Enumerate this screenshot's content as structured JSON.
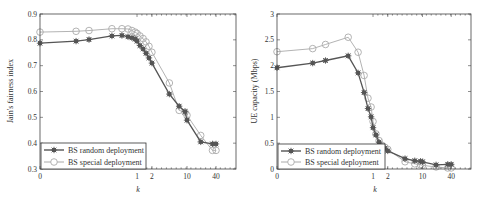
{
  "chart_data": [
    {
      "type": "line",
      "title": "",
      "xlabel": "k",
      "ylabel": "Jain's fairness index",
      "xscale": "symlog",
      "xticks": [
        "0",
        "1",
        "2",
        "10",
        "40"
      ],
      "xtick_pos": [
        0.0,
        0.495,
        0.571,
        0.75,
        0.898
      ],
      "ylim": [
        0.3,
        0.9
      ],
      "yticks": [
        "0.3",
        "0.4",
        "0.5",
        "0.6",
        "0.7",
        "0.8",
        "0.9"
      ],
      "grid": false,
      "legend_position": "lower left",
      "x_pos": [
        0.0,
        0.184,
        0.25,
        0.367,
        0.418,
        0.449,
        0.469,
        0.485,
        0.495,
        0.51,
        0.526,
        0.541,
        0.556,
        0.571,
        0.66,
        0.71,
        0.74,
        0.75,
        0.82,
        0.88,
        0.898
      ],
      "series": [
        {
          "name": "BS random deployment",
          "color": "#555555",
          "marker": "asterisk-square",
          "values": [
            0.787,
            0.795,
            0.801,
            0.815,
            0.817,
            0.812,
            0.808,
            0.803,
            0.795,
            0.778,
            0.765,
            0.748,
            0.73,
            0.71,
            0.59,
            0.543,
            0.522,
            0.489,
            0.405,
            0.397,
            0.397
          ]
        },
        {
          "name": "BS special deployment",
          "color": "#aaaaaa",
          "marker": "circle",
          "values": [
            0.83,
            0.833,
            0.836,
            0.843,
            0.843,
            0.842,
            0.836,
            0.83,
            0.825,
            0.815,
            0.805,
            0.792,
            0.775,
            0.752,
            0.633,
            0.527,
            0.52,
            0.508,
            0.43,
            0.372,
            0.372
          ]
        }
      ]
    },
    {
      "type": "line",
      "title": "",
      "xlabel": "k",
      "ylabel": "UE capacity (Mbps)",
      "xscale": "symlog",
      "xticks": [
        "0",
        "1",
        "2",
        "10",
        "40"
      ],
      "xtick_pos": [
        0.0,
        0.495,
        0.571,
        0.75,
        0.898
      ],
      "ylim": [
        0,
        3
      ],
      "yticks": [
        "0",
        "0.5",
        "1",
        "1.5",
        "2",
        "2.5",
        "3"
      ],
      "grid": false,
      "legend_position": "lower left",
      "x_pos": [
        0.0,
        0.184,
        0.25,
        0.367,
        0.418,
        0.449,
        0.469,
        0.485,
        0.495,
        0.51,
        0.526,
        0.541,
        0.556,
        0.571,
        0.66,
        0.71,
        0.74,
        0.75,
        0.82,
        0.88,
        0.898
      ],
      "series": [
        {
          "name": "BS random deployment",
          "color": "#555555",
          "marker": "asterisk-square",
          "values": [
            1.96,
            2.05,
            2.1,
            2.19,
            1.86,
            1.48,
            1.17,
            1.01,
            0.8,
            0.66,
            0.52,
            0.45,
            0.4,
            0.35,
            0.2,
            0.16,
            0.15,
            0.14,
            0.08,
            0.09,
            0.09
          ]
        },
        {
          "name": "BS special deployment",
          "color": "#aaaaaa",
          "marker": "circle",
          "values": [
            2.27,
            2.33,
            2.41,
            2.55,
            2.26,
            1.81,
            1.37,
            1.2,
            0.92,
            0.68,
            0.55,
            0.46,
            0.42,
            0.38,
            0.14,
            0.1,
            0.08,
            0.07,
            0.04,
            0.02,
            0.02
          ]
        }
      ]
    }
  ],
  "plots": [
    {
      "ylabel": "Jain's fairness index",
      "xlabel": "k",
      "legend": [
        "BS random deployment",
        "BS special deployment"
      ]
    },
    {
      "ylabel": "UE capacity (Mbps)",
      "xlabel": "k",
      "legend": [
        "BS random deployment",
        "BS special deployment"
      ]
    }
  ]
}
